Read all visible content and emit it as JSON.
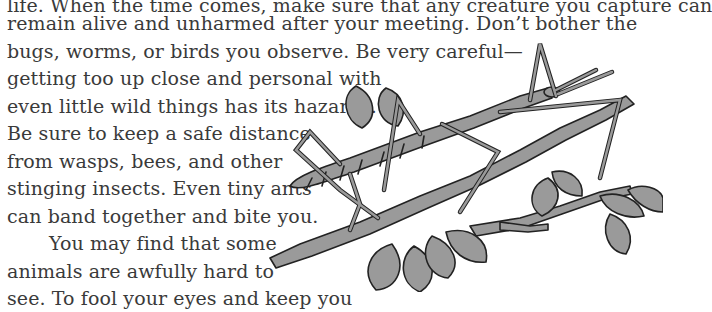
{
  "document": {
    "lines": [
      "life. When the time comes, make sure that any creature you capture can",
      "remain alive and unharmed after your meeting. Don’t bother the",
      "bugs, worms, or birds you observe. Be very careful—",
      "getting too up close and personal with",
      "even little wild things has its hazards.",
      "Be sure to keep a safe distance",
      "from wasps, bees, and other",
      "stinging insects. Even tiny ants",
      "can band together and bite you.",
      "You may find that some",
      "animals are awfully hard to",
      "see. To fool your eyes and keep you"
    ]
  },
  "illustration": {
    "subject": "walking stick insect on a leafy branch",
    "fill_color": "#9a9a9a",
    "outline_color": "#222222"
  }
}
